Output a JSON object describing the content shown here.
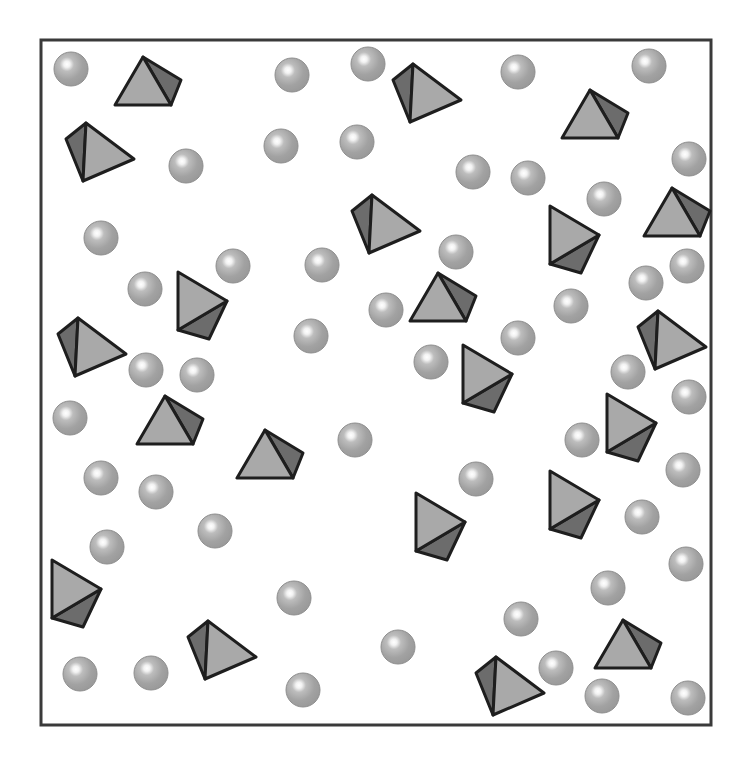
{
  "scene": {
    "width": 752,
    "height": 768,
    "background": "#ffffff",
    "frame": {
      "x": 41,
      "y": 40,
      "width": 670,
      "height": 685,
      "stroke": "#3a3a3a",
      "stroke_width": 3
    }
  },
  "colors": {
    "sphere_fill": "#a4a4a4",
    "sphere_edge": "#8e8e8e",
    "sphere_highlight": "#ffffff",
    "pyramid_light": "#a9a9a9",
    "pyramid_dark": "#6c6c6c",
    "pyramid_stroke": "#1e1e1e"
  },
  "sphere_radius": 17,
  "spheres": [
    [
      71,
      69
    ],
    [
      292,
      75
    ],
    [
      368,
      64
    ],
    [
      518,
      72
    ],
    [
      649,
      66
    ],
    [
      186,
      166
    ],
    [
      281,
      146
    ],
    [
      357,
      142
    ],
    [
      473,
      172
    ],
    [
      528,
      178
    ],
    [
      689,
      159
    ],
    [
      604,
      199
    ],
    [
      101,
      238
    ],
    [
      233,
      266
    ],
    [
      322,
      265
    ],
    [
      456,
      252
    ],
    [
      145,
      289
    ],
    [
      646,
      283
    ],
    [
      687,
      266
    ],
    [
      386,
      310
    ],
    [
      571,
      306
    ],
    [
      311,
      336
    ],
    [
      518,
      338
    ],
    [
      146,
      370
    ],
    [
      197,
      375
    ],
    [
      431,
      362
    ],
    [
      628,
      372
    ],
    [
      689,
      397
    ],
    [
      70,
      418
    ],
    [
      355,
      440
    ],
    [
      582,
      440
    ],
    [
      101,
      478
    ],
    [
      156,
      492
    ],
    [
      476,
      479
    ],
    [
      683,
      470
    ],
    [
      215,
      531
    ],
    [
      642,
      517
    ],
    [
      107,
      547
    ],
    [
      686,
      564
    ],
    [
      294,
      598
    ],
    [
      608,
      588
    ],
    [
      521,
      619
    ],
    [
      398,
      647
    ],
    [
      80,
      674
    ],
    [
      151,
      673
    ],
    [
      303,
      690
    ],
    [
      556,
      668
    ],
    [
      602,
      696
    ],
    [
      688,
      698
    ]
  ],
  "pyramids": {
    "upright_dark_right": [
      [
        143,
        57
      ],
      [
        590,
        90
      ],
      [
        672,
        188
      ],
      [
        438,
        273
      ],
      [
        165,
        396
      ],
      [
        265,
        430
      ],
      [
        623,
        620
      ]
    ],
    "pointing_right_dark_bottom": [
      [
        178,
        272
      ],
      [
        550,
        206
      ],
      [
        463,
        345
      ],
      [
        607,
        394
      ],
      [
        416,
        493
      ],
      [
        550,
        471
      ],
      [
        52,
        560
      ]
    ],
    "dark_left": [
      [
        86,
        123
      ],
      [
        413,
        64
      ],
      [
        372,
        195
      ],
      [
        78,
        318
      ],
      [
        658,
        311
      ],
      [
        208,
        621
      ],
      [
        496,
        657
      ]
    ]
  }
}
